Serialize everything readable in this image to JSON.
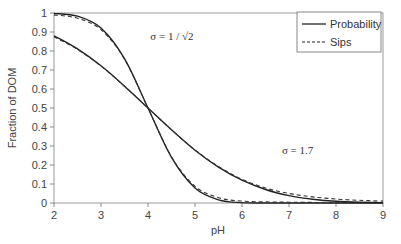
{
  "chart_data": {
    "type": "line",
    "title": "",
    "xlabel": "pH",
    "ylabel": "Fraction of DOM",
    "xlim": [
      2,
      9
    ],
    "ylim": [
      0,
      1
    ],
    "xticks": [
      "2",
      "3",
      "4",
      "5",
      "6",
      "7",
      "8",
      "9"
    ],
    "yticks": [
      "0",
      "0.1",
      "0.2",
      "0.3",
      "0.4",
      "0.5",
      "0.6",
      "0.7",
      "0.8",
      "0.9",
      "1"
    ],
    "grid": false,
    "legend": {
      "position": "upper right",
      "entries": [
        {
          "label": "Probability",
          "style": "solid"
        },
        {
          "label": "Sips",
          "style": "dashed"
        }
      ]
    },
    "annotations": [
      {
        "text": "σ = 1 / √2",
        "x": 4.05,
        "y": 0.86
      },
      {
        "text": "σ = 1.7",
        "x": 6.85,
        "y": 0.26
      }
    ],
    "x": [
      2,
      2.5,
      3,
      3.5,
      4,
      4.5,
      5,
      5.5,
      6,
      6.5,
      7,
      7.5,
      8,
      8.5,
      9
    ],
    "series": [
      {
        "name": "Probability (σ = 1/√2)",
        "style": "solid",
        "values": [
          0.998,
          0.983,
          0.921,
          0.76,
          0.5,
          0.24,
          0.079,
          0.017,
          0.002,
          0.0,
          0.0,
          0.0,
          0.0,
          0.0,
          0.0
        ]
      },
      {
        "name": "Sips (σ = 1/√2)",
        "style": "dashed",
        "values": [
          0.99,
          0.972,
          0.912,
          0.757,
          0.5,
          0.243,
          0.088,
          0.028,
          0.01,
          0.006,
          0.004,
          0.003,
          0.002,
          0.002,
          0.001
        ]
      },
      {
        "name": "Probability (σ = 1.7)",
        "style": "solid",
        "values": [
          0.88,
          0.811,
          0.722,
          0.615,
          0.5,
          0.385,
          0.278,
          0.189,
          0.12,
          0.071,
          0.039,
          0.02,
          0.009,
          0.004,
          0.002
        ]
      },
      {
        "name": "Sips (σ = 1.7)",
        "style": "dashed",
        "values": [
          0.875,
          0.808,
          0.721,
          0.615,
          0.5,
          0.385,
          0.279,
          0.192,
          0.125,
          0.079,
          0.05,
          0.032,
          0.021,
          0.014,
          0.01
        ]
      }
    ]
  }
}
